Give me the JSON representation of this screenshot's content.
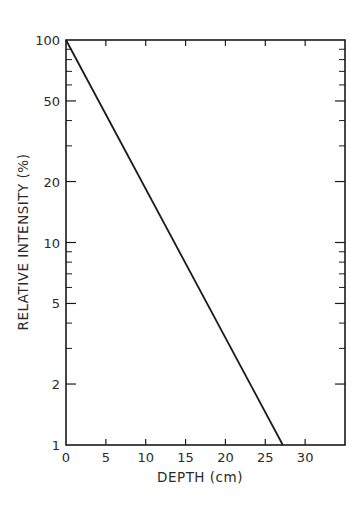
{
  "chart_data": {
    "type": "line",
    "title": "",
    "xlabel": "DEPTH (cm)",
    "ylabel": "RELATIVE INTENSITY (%)",
    "xlim": [
      0,
      35
    ],
    "ylim": [
      1,
      100
    ],
    "yscale": "log",
    "grid": false,
    "legend": null,
    "x_ticks": [
      0,
      5,
      10,
      15,
      20,
      25,
      30
    ],
    "y_ticks": [
      1,
      2,
      5,
      10,
      20,
      50,
      100
    ],
    "y_minor_ticks": [
      3,
      4,
      6,
      7,
      8,
      9,
      30,
      40,
      60,
      70,
      80,
      90
    ],
    "series": [
      {
        "name": "Relative intensity",
        "x": [
          0,
          27.2
        ],
        "y": [
          100,
          1
        ],
        "color": "#1a1a1a"
      }
    ]
  },
  "colors": {
    "ink": "#1a1a1a",
    "background": "#ffffff"
  }
}
